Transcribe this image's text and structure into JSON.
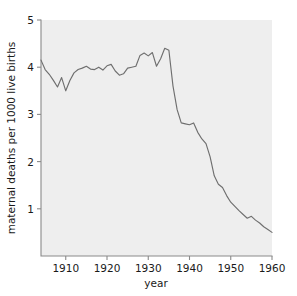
{
  "figure": {
    "background_color": "#ffffff",
    "plot_background_color": "#eeeeee",
    "axis_color": "#8a8a8a",
    "line_color": "#6f6f6f"
  },
  "chart_data": {
    "type": "line",
    "title": "",
    "xlabel": "year",
    "ylabel": "maternal deaths per 1000 live births",
    "xlim": [
      1904,
      1960
    ],
    "ylim": [
      0,
      5
    ],
    "xticks": [
      1910,
      1920,
      1930,
      1940,
      1950,
      1960
    ],
    "xtick_labels": [
      "1910",
      "1920",
      "1930",
      "1940",
      "1950",
      "1960"
    ],
    "yticks": [
      1,
      2,
      3,
      4,
      5
    ],
    "ytick_labels": [
      "1",
      "2",
      "3",
      "4",
      "5"
    ],
    "grid": false,
    "legend": false,
    "legend_position": "none",
    "series": [
      {
        "name": "maternal deaths per 1000 live births",
        "color": "#6f6f6f",
        "x": [
          1904,
          1905,
          1906,
          1907,
          1908,
          1909,
          1910,
          1911,
          1912,
          1913,
          1914,
          1915,
          1916,
          1917,
          1918,
          1919,
          1920,
          1921,
          1922,
          1923,
          1924,
          1925,
          1926,
          1927,
          1928,
          1929,
          1930,
          1931,
          1932,
          1933,
          1934,
          1935,
          1936,
          1937,
          1938,
          1939,
          1940,
          1941,
          1942,
          1943,
          1944,
          1945,
          1946,
          1947,
          1948,
          1949,
          1950,
          1951,
          1952,
          1953,
          1954,
          1955,
          1956,
          1957,
          1958,
          1959,
          1960
        ],
        "y": [
          4.15,
          3.95,
          3.85,
          3.72,
          3.58,
          3.78,
          3.5,
          3.72,
          3.88,
          3.95,
          3.98,
          4.02,
          3.96,
          3.95,
          4.0,
          3.94,
          4.03,
          4.06,
          3.92,
          3.83,
          3.86,
          3.98,
          4.0,
          4.02,
          4.25,
          4.3,
          4.24,
          4.31,
          4.02,
          4.18,
          4.4,
          4.36,
          3.6,
          3.1,
          2.82,
          2.8,
          2.78,
          2.82,
          2.62,
          2.48,
          2.38,
          2.1,
          1.7,
          1.52,
          1.45,
          1.28,
          1.14,
          1.05,
          0.96,
          0.88,
          0.8,
          0.84,
          0.76,
          0.7,
          0.62,
          0.56,
          0.5
        ]
      }
    ]
  }
}
